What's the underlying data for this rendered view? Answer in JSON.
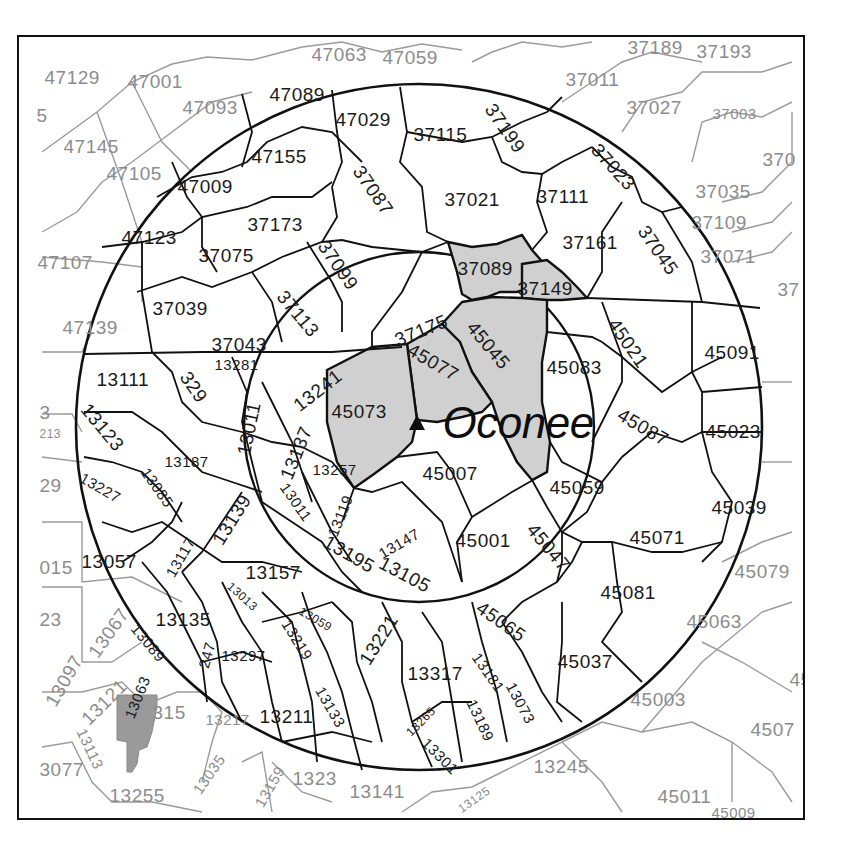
{
  "map": {
    "site": {
      "name": "Oconee",
      "marker": "triangle-marker-icon",
      "x": 417,
      "y": 425
    },
    "colors": {
      "frame": "#111111",
      "ring": "#111111",
      "inner_boundary": "#111111",
      "outer_boundary": "#9a9a9a",
      "outer_label": "#8c8c8c",
      "shaded_core": "#d0d0d0",
      "shaded_remote": "#9a9a9a"
    },
    "rings": [
      {
        "name": "inner-ring",
        "cx": 417,
        "cy": 425,
        "r": 175
      },
      {
        "name": "outer-ring",
        "cx": 417,
        "cy": 425,
        "r": 343
      }
    ],
    "shaded_counties": [
      "37089",
      "37149",
      "45045",
      "45073",
      "45077"
    ],
    "highlighted_remote_county": "13063",
    "labels": [
      {
        "code": "47129",
        "x": 45,
        "y": 68,
        "cls": "outer",
        "rot": 0
      },
      {
        "code": "47001",
        "x": 128,
        "y": 72,
        "cls": "outer",
        "rot": 0
      },
      {
        "code": "47063",
        "x": 312,
        "y": 45,
        "cls": "outer",
        "rot": 0
      },
      {
        "code": "47059",
        "x": 383,
        "y": 48,
        "cls": "outer",
        "rot": 0
      },
      {
        "code": "37189",
        "x": 628,
        "y": 38,
        "cls": "outer",
        "rot": 0
      },
      {
        "code": "37193",
        "x": 697,
        "y": 42,
        "cls": "outer",
        "rot": 0
      },
      {
        "code": "5",
        "x": 37,
        "y": 106,
        "cls": "outer",
        "rot": 0
      },
      {
        "code": "47093",
        "x": 183,
        "y": 98,
        "cls": "outer",
        "rot": 0
      },
      {
        "code": "47089",
        "x": 270,
        "y": 85,
        "cls": "inner",
        "rot": 0
      },
      {
        "code": "47029",
        "x": 336,
        "y": 110,
        "cls": "inner",
        "rot": 0
      },
      {
        "code": "37115",
        "x": 414,
        "y": 125,
        "cls": "inner",
        "rot": 0
      },
      {
        "code": "37199",
        "x": 497,
        "y": 100,
        "cls": "inner",
        "rot": 55
      },
      {
        "code": "37011",
        "x": 566,
        "y": 70,
        "cls": "outer",
        "rot": 0
      },
      {
        "code": "37027",
        "x": 627,
        "y": 98,
        "cls": "outer",
        "rot": 0
      },
      {
        "code": "37003",
        "x": 713,
        "y": 106,
        "cls": "outer",
        "rot": 0,
        "small": true
      },
      {
        "code": "370",
        "x": 763,
        "y": 150,
        "cls": "outer",
        "rot": 0
      },
      {
        "code": "47145",
        "x": 64,
        "y": 137,
        "cls": "outer",
        "rot": 0
      },
      {
        "code": "47105",
        "x": 107,
        "y": 164,
        "cls": "outer",
        "rot": 0
      },
      {
        "code": "47155",
        "x": 252,
        "y": 147,
        "cls": "inner",
        "rot": 0
      },
      {
        "code": "47009",
        "x": 178,
        "y": 177,
        "cls": "inner",
        "rot": 0
      },
      {
        "code": "37087",
        "x": 365,
        "y": 162,
        "cls": "inner",
        "rot": 55
      },
      {
        "code": "37021",
        "x": 445,
        "y": 190,
        "cls": "inner",
        "rot": 0
      },
      {
        "code": "37111",
        "x": 537,
        "y": 187,
        "cls": "inner",
        "rot": 0
      },
      {
        "code": "37023",
        "x": 602,
        "y": 140,
        "cls": "inner",
        "rot": 48
      },
      {
        "code": "37035",
        "x": 696,
        "y": 182,
        "cls": "outer",
        "rot": 0
      },
      {
        "code": "47123",
        "x": 122,
        "y": 228,
        "cls": "inner",
        "rot": 0
      },
      {
        "code": "37173",
        "x": 248,
        "y": 215,
        "cls": "inner",
        "rot": 0
      },
      {
        "code": "37161",
        "x": 563,
        "y": 233,
        "cls": "inner",
        "rot": 0
      },
      {
        "code": "37045",
        "x": 650,
        "y": 222,
        "cls": "inner",
        "rot": 55
      },
      {
        "code": "37109",
        "x": 692,
        "y": 213,
        "cls": "outer",
        "rot": 0
      },
      {
        "code": "37071",
        "x": 701,
        "y": 247,
        "cls": "outer",
        "rot": 0
      },
      {
        "code": "47107",
        "x": 38,
        "y": 253,
        "cls": "outer",
        "rot": 0
      },
      {
        "code": "37075",
        "x": 199,
        "y": 246,
        "cls": "inner",
        "rot": 0
      },
      {
        "code": "37099",
        "x": 330,
        "y": 237,
        "cls": "inner",
        "rot": 55
      },
      {
        "code": "37089",
        "x": 458,
        "y": 259,
        "cls": "inner",
        "rot": 0
      },
      {
        "code": "37149",
        "x": 518,
        "y": 279,
        "cls": "inner",
        "rot": 0
      },
      {
        "code": "37",
        "x": 778,
        "y": 280,
        "cls": "outer",
        "rot": 0
      },
      {
        "code": "47139",
        "x": 63,
        "y": 318,
        "cls": "outer",
        "rot": 0
      },
      {
        "code": "37039",
        "x": 153,
        "y": 299,
        "cls": "inner",
        "rot": 0
      },
      {
        "code": "37113",
        "x": 288,
        "y": 287,
        "cls": "inner",
        "rot": 50
      },
      {
        "code": "37175",
        "x": 392,
        "y": 332,
        "cls": "inner",
        "rot": -22
      },
      {
        "code": "45045",
        "x": 478,
        "y": 318,
        "cls": "inner",
        "rot": 50
      },
      {
        "code": "45021",
        "x": 620,
        "y": 315,
        "cls": "inner",
        "rot": 55
      },
      {
        "code": "45091",
        "x": 705,
        "y": 343,
        "cls": "inner",
        "rot": 0
      },
      {
        "code": "37043",
        "x": 212,
        "y": 335,
        "cls": "inner",
        "rot": 0
      },
      {
        "code": "13281",
        "x": 215,
        "y": 357,
        "cls": "inner",
        "rot": 0,
        "small": true
      },
      {
        "code": "13111",
        "x": 97,
        "y": 370,
        "cls": "inner",
        "rot": 0
      },
      {
        "code": "13241",
        "x": 290,
        "y": 400,
        "cls": "inner",
        "rot": -38
      },
      {
        "code": "45077",
        "x": 414,
        "y": 340,
        "cls": "inner",
        "rot": 30
      },
      {
        "code": "45083",
        "x": 547,
        "y": 358,
        "cls": "inner",
        "rot": 0
      },
      {
        "code": "329",
        "x": 192,
        "y": 368,
        "cls": "inner",
        "rot": 55
      },
      {
        "code": "13123",
        "x": 92,
        "y": 400,
        "cls": "inner",
        "rot": 50
      },
      {
        "code": "3",
        "x": 40,
        "y": 403,
        "cls": "outer",
        "rot": 0
      },
      {
        "code": "213",
        "x": 40,
        "y": 428,
        "cls": "outer",
        "rot": 0,
        "tiny": true
      },
      {
        "code": "45073",
        "x": 332,
        "y": 402,
        "cls": "inner",
        "rot": 0
      },
      {
        "code": "45087",
        "x": 624,
        "y": 405,
        "cls": "inner",
        "rot": 30
      },
      {
        "code": "45023",
        "x": 706,
        "y": 422,
        "cls": "inner",
        "rot": 0
      },
      {
        "code": "13011",
        "x": 234,
        "y": 453,
        "cls": "inner",
        "rot": -78
      },
      {
        "code": "13137",
        "x": 277,
        "y": 475,
        "cls": "inner",
        "rot": -68
      },
      {
        "code": "13187",
        "x": 165,
        "y": 454,
        "cls": "inner",
        "rot": 0,
        "small": true
      },
      {
        "code": "13257",
        "x": 313,
        "y": 462,
        "cls": "inner",
        "rot": 0,
        "small": true
      },
      {
        "code": "45007",
        "x": 423,
        "y": 464,
        "cls": "inner",
        "rot": 0
      },
      {
        "code": "29",
        "x": 40,
        "y": 476,
        "cls": "outer",
        "rot": 0
      },
      {
        "code": "13227",
        "x": 85,
        "y": 470,
        "cls": "inner",
        "rot": 30,
        "small": true
      },
      {
        "code": "13085",
        "x": 151,
        "y": 465,
        "cls": "inner",
        "rot": 55,
        "small": true
      },
      {
        "code": "13119",
        "x": 325,
        "y": 533,
        "cls": "inner",
        "rot": -68,
        "small": true
      },
      {
        "code": "13011",
        "x": 290,
        "y": 480,
        "cls": "inner",
        "rot": 55,
        "small": true,
        "alias": "13011b"
      },
      {
        "code": "45059",
        "x": 550,
        "y": 478,
        "cls": "inner",
        "rot": 0
      },
      {
        "code": "45039",
        "x": 712,
        "y": 498,
        "cls": "inner",
        "rot": 0
      },
      {
        "code": "13139",
        "x": 209,
        "y": 538,
        "cls": "inner",
        "rot": -58
      },
      {
        "code": "13147",
        "x": 376,
        "y": 548,
        "cls": "inner",
        "rot": -30,
        "small": true
      },
      {
        "code": "45001",
        "x": 456,
        "y": 531,
        "cls": "inner",
        "rot": 0
      },
      {
        "code": "45047",
        "x": 538,
        "y": 520,
        "cls": "inner",
        "rot": 50
      },
      {
        "code": "45071",
        "x": 630,
        "y": 528,
        "cls": "inner",
        "rot": 0
      },
      {
        "code": "015",
        "x": 40,
        "y": 558,
        "cls": "outer",
        "rot": 0
      },
      {
        "code": "13057",
        "x": 82,
        "y": 552,
        "cls": "inner",
        "rot": 0
      },
      {
        "code": "13117",
        "x": 163,
        "y": 572,
        "cls": "inner",
        "rot": -60,
        "small": true
      },
      {
        "code": "13195",
        "x": 330,
        "y": 532,
        "cls": "inner",
        "rot": 30
      },
      {
        "code": "13105",
        "x": 385,
        "y": 553,
        "cls": "inner",
        "rot": 28
      },
      {
        "code": "45079",
        "x": 735,
        "y": 562,
        "cls": "outer",
        "rot": 0
      },
      {
        "code": "13157",
        "x": 246,
        "y": 563,
        "cls": "inner",
        "rot": 0
      },
      {
        "code": "45081",
        "x": 601,
        "y": 583,
        "cls": "inner",
        "rot": 0
      },
      {
        "code": "23",
        "x": 40,
        "y": 610,
        "cls": "outer",
        "rot": 0
      },
      {
        "code": "13067",
        "x": 85,
        "y": 650,
        "cls": "outer",
        "rot": -55
      },
      {
        "code": "13135",
        "x": 156,
        "y": 610,
        "cls": "inner",
        "rot": 0
      },
      {
        "code": "13013",
        "x": 233,
        "y": 580,
        "cls": "inner",
        "rot": 42,
        "tiny": true
      },
      {
        "code": "13059",
        "x": 303,
        "y": 605,
        "cls": "inner",
        "rot": 30,
        "tiny": true
      },
      {
        "code": "13221",
        "x": 356,
        "y": 658,
        "cls": "inner",
        "rot": -58
      },
      {
        "code": "45065",
        "x": 484,
        "y": 598,
        "cls": "inner",
        "rot": 35
      },
      {
        "code": "45063",
        "x": 687,
        "y": 612,
        "cls": "outer",
        "rot": 0
      },
      {
        "code": "13089",
        "x": 140,
        "y": 621,
        "cls": "inner",
        "rot": 50,
        "small": true
      },
      {
        "code": "13297",
        "x": 222,
        "y": 648,
        "cls": "inner",
        "rot": 0,
        "small": true
      },
      {
        "code": "13219",
        "x": 292,
        "y": 617,
        "cls": "inner",
        "rot": 58,
        "small": true
      },
      {
        "code": "13317",
        "x": 408,
        "y": 664,
        "cls": "inner",
        "rot": 0
      },
      {
        "code": "13181",
        "x": 482,
        "y": 650,
        "cls": "inner",
        "rot": 55,
        "small": true
      },
      {
        "code": "45037",
        "x": 558,
        "y": 652,
        "cls": "inner",
        "rot": 0
      },
      {
        "code": "13097",
        "x": 42,
        "y": 700,
        "cls": "outer",
        "rot": -60
      },
      {
        "code": "13121",
        "x": 78,
        "y": 715,
        "cls": "outer",
        "rot": -45
      },
      {
        "code": "247",
        "x": 196,
        "y": 666,
        "cls": "inner",
        "rot": -75,
        "small": true
      },
      {
        "code": "13063",
        "x": 122,
        "y": 715,
        "cls": "inner",
        "rot": -68,
        "small": true
      },
      {
        "code": "45003",
        "x": 631,
        "y": 690,
        "cls": "outer",
        "rot": 0
      },
      {
        "code": "4507",
        "x": 751,
        "y": 720,
        "cls": "outer",
        "rot": 0
      },
      {
        "code": "13217",
        "x": 206,
        "y": 712,
        "cls": "outer",
        "rot": 0,
        "small": true
      },
      {
        "code": "13211",
        "x": 260,
        "y": 707,
        "cls": "inner",
        "rot": 0
      },
      {
        "code": "13133",
        "x": 326,
        "y": 684,
        "cls": "inner",
        "rot": 60,
        "small": true
      },
      {
        "code": "13265",
        "x": 404,
        "y": 730,
        "cls": "inner",
        "rot": -45,
        "tiny": true
      },
      {
        "code": "13189",
        "x": 478,
        "y": 697,
        "cls": "inner",
        "rot": 65,
        "small": true
      },
      {
        "code": "13073",
        "x": 517,
        "y": 680,
        "cls": "inner",
        "rot": 62,
        "small": true
      },
      {
        "code": "45",
        "x": 790,
        "y": 670,
        "cls": "outer",
        "rot": 0
      },
      {
        "code": "315",
        "x": 153,
        "y": 703,
        "cls": "outer",
        "rot": 0
      },
      {
        "code": "13301",
        "x": 430,
        "y": 735,
        "cls": "inner",
        "rot": 45,
        "small": true
      },
      {
        "code": "3077",
        "x": 40,
        "y": 760,
        "cls": "outer",
        "rot": 0
      },
      {
        "code": "13113",
        "x": 88,
        "y": 726,
        "cls": "outer",
        "rot": 65,
        "small": true
      },
      {
        "code": "13035",
        "x": 190,
        "y": 788,
        "cls": "outer",
        "rot": -55,
        "small": true
      },
      {
        "code": "13159",
        "x": 252,
        "y": 802,
        "cls": "outer",
        "rot": -60,
        "small": true
      },
      {
        "code": "1323",
        "x": 293,
        "y": 769,
        "cls": "outer",
        "rot": 0
      },
      {
        "code": "13141",
        "x": 350,
        "y": 782,
        "cls": "outer",
        "rot": 0
      },
      {
        "code": "13125",
        "x": 456,
        "y": 805,
        "cls": "outer",
        "rot": -35,
        "tiny": true
      },
      {
        "code": "13245",
        "x": 534,
        "y": 757,
        "cls": "outer",
        "rot": 0
      },
      {
        "code": "13255",
        "x": 110,
        "y": 786,
        "cls": "outer",
        "rot": 0
      },
      {
        "code": "45011",
        "x": 658,
        "y": 787,
        "cls": "outer",
        "rot": 0
      },
      {
        "code": "45009",
        "x": 712,
        "y": 805,
        "cls": "outer",
        "rot": 0,
        "small": true
      }
    ]
  }
}
